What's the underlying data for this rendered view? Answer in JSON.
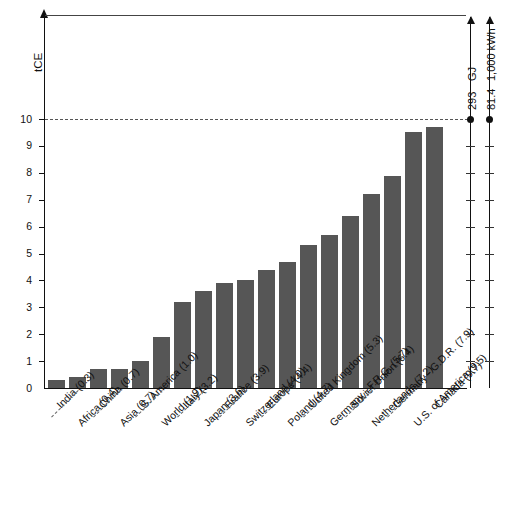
{
  "chart_data": {
    "type": "bar",
    "title": "",
    "xlabel": "",
    "ylabel": "tCE",
    "ylim": [
      0,
      11.6
    ],
    "yticks": [
      0,
      1,
      2,
      3,
      4,
      5,
      6,
      7,
      8,
      9,
      10
    ],
    "grid": false,
    "legend": "none",
    "categories": [
      "India (0.3)",
      "Africa (0.4)",
      "China (0.7)",
      "Asia (0.7)",
      "S. America (1.0)",
      "World (1.9)",
      "Italy (3.2)",
      "Japan (3.6)",
      "France (3.9)",
      "Switzerland (4.0)",
      "Europe (4.4)",
      "Poland (4.7)",
      "United Kingdom (5.3)",
      "Germany - F.R.G. (5.7)",
      "Soviet Union (6.4)",
      "Netherlands (7.2)",
      "Germany - G.D.R. (7.9)",
      "U.S. of America (9.5)",
      "Canada (9.7)"
    ],
    "names": [
      "India",
      "Africa",
      "China",
      "Asia",
      "S. America",
      "World",
      "Italy",
      "Japan",
      "France",
      "Switzerland",
      "Europe",
      "Poland",
      "United Kingdom",
      "Germany - F.R.G.",
      "Soviet Union",
      "Netherlands",
      "Germany - G.D.R.",
      "U.S. of America",
      "Canada"
    ],
    "values": [
      0.3,
      0.4,
      0.7,
      0.7,
      1.0,
      1.9,
      3.2,
      3.6,
      3.9,
      4.0,
      4.4,
      4.7,
      5.3,
      5.7,
      6.4,
      7.2,
      7.9,
      9.5,
      9.7
    ],
    "annotations": [
      {
        "value_line": 10,
        "style": "dashed",
        "label": ""
      }
    ],
    "secondary_axes": [
      {
        "name": "gigajoule-scale",
        "value": "293",
        "unit": "GJ",
        "at_level": 10
      },
      {
        "name": "kilowatt-hour-scale",
        "value": "81.4",
        "unit": "1,000 kWh",
        "at_level": 10
      }
    ],
    "bar_color": "#565656",
    "axis_color": "#111111",
    "gridline_color": "#555555"
  }
}
